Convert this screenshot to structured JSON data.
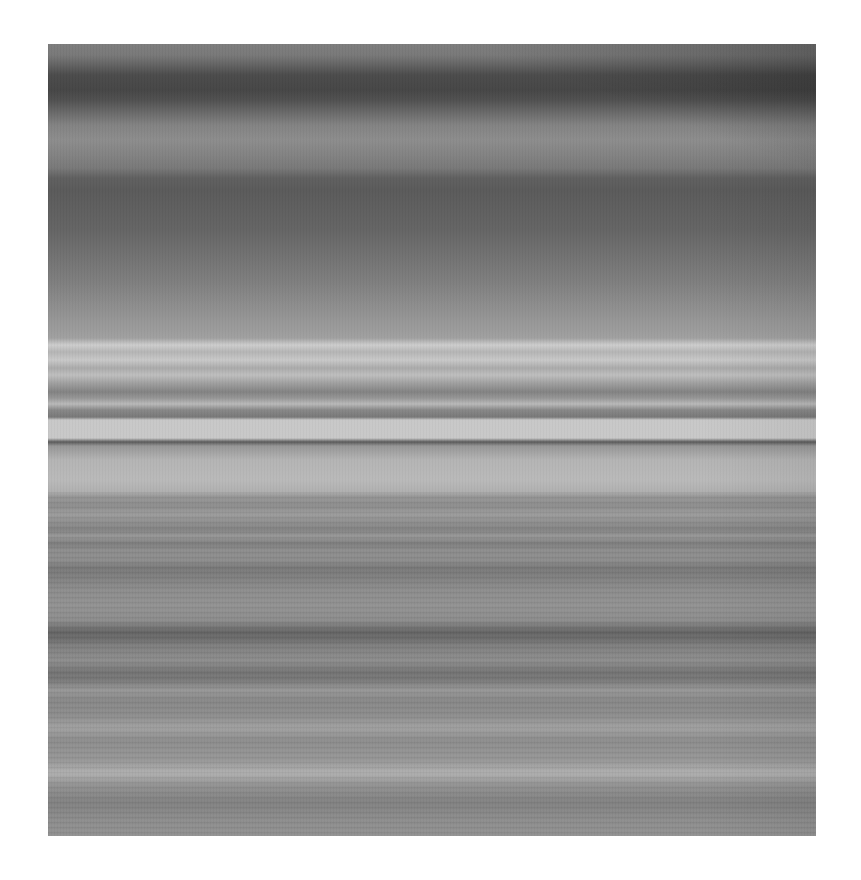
{
  "image": {
    "subject": "grayscale horizontal banded texture (planetary ring-like striations)",
    "frame": {
      "x": 48,
      "y": 44,
      "width": 768,
      "height": 792
    },
    "background": "#ffffff",
    "band_profile": [
      {
        "y": 0,
        "gray": 125
      },
      {
        "y": 11,
        "gray": 120
      },
      {
        "y": 18,
        "gray": 105
      },
      {
        "y": 31,
        "gray": 75
      },
      {
        "y": 46,
        "gray": 70
      },
      {
        "y": 56,
        "gray": 80
      },
      {
        "y": 66,
        "gray": 100
      },
      {
        "y": 81,
        "gray": 130
      },
      {
        "y": 96,
        "gray": 140
      },
      {
        "y": 111,
        "gray": 130
      },
      {
        "y": 124,
        "gray": 120
      },
      {
        "y": 134,
        "gray": 95
      },
      {
        "y": 146,
        "gray": 90
      },
      {
        "y": 186,
        "gray": 100
      },
      {
        "y": 236,
        "gray": 125
      },
      {
        "y": 276,
        "gray": 150
      },
      {
        "y": 294,
        "gray": 160
      },
      {
        "y": 301,
        "gray": 205
      },
      {
        "y": 308,
        "gray": 180
      },
      {
        "y": 316,
        "gray": 200
      },
      {
        "y": 324,
        "gray": 170
      },
      {
        "y": 331,
        "gray": 190
      },
      {
        "y": 339,
        "gray": 160
      },
      {
        "y": 348,
        "gray": 130
      },
      {
        "y": 354,
        "gray": 150
      },
      {
        "y": 360,
        "gray": 185
      },
      {
        "y": 366,
        "gray": 135
      },
      {
        "y": 373,
        "gray": 120
      },
      {
        "y": 376,
        "gray": 200
      },
      {
        "y": 394,
        "gray": 200
      },
      {
        "y": 398,
        "gray": 90
      },
      {
        "y": 402,
        "gray": 150
      },
      {
        "y": 416,
        "gray": 180
      },
      {
        "y": 436,
        "gray": 185
      },
      {
        "y": 448,
        "gray": 175
      },
      {
        "y": 452,
        "gray": 150
      },
      {
        "y": 462,
        "gray": 140
      },
      {
        "y": 470,
        "gray": 155
      },
      {
        "y": 476,
        "gray": 145
      },
      {
        "y": 486,
        "gray": 130
      },
      {
        "y": 492,
        "gray": 150
      },
      {
        "y": 500,
        "gray": 125
      },
      {
        "y": 506,
        "gray": 140
      },
      {
        "y": 516,
        "gray": 140
      },
      {
        "y": 524,
        "gray": 120
      },
      {
        "y": 531,
        "gray": 125
      },
      {
        "y": 546,
        "gray": 140
      },
      {
        "y": 561,
        "gray": 145
      },
      {
        "y": 576,
        "gray": 140
      },
      {
        "y": 588,
        "gray": 100
      },
      {
        "y": 596,
        "gray": 110
      },
      {
        "y": 601,
        "gray": 125
      },
      {
        "y": 616,
        "gray": 140
      },
      {
        "y": 624,
        "gray": 125
      },
      {
        "y": 628,
        "gray": 115
      },
      {
        "y": 636,
        "gray": 120
      },
      {
        "y": 646,
        "gray": 150
      },
      {
        "y": 656,
        "gray": 135
      },
      {
        "y": 671,
        "gray": 140
      },
      {
        "y": 684,
        "gray": 160
      },
      {
        "y": 696,
        "gray": 140
      },
      {
        "y": 716,
        "gray": 150
      },
      {
        "y": 729,
        "gray": 175
      },
      {
        "y": 741,
        "gray": 145
      },
      {
        "y": 756,
        "gray": 130
      },
      {
        "y": 761,
        "gray": 130
      },
      {
        "y": 776,
        "gray": 140
      },
      {
        "y": 792,
        "gray": 145
      }
    ],
    "right_edge_shade": "top-right corner slightly darker"
  }
}
